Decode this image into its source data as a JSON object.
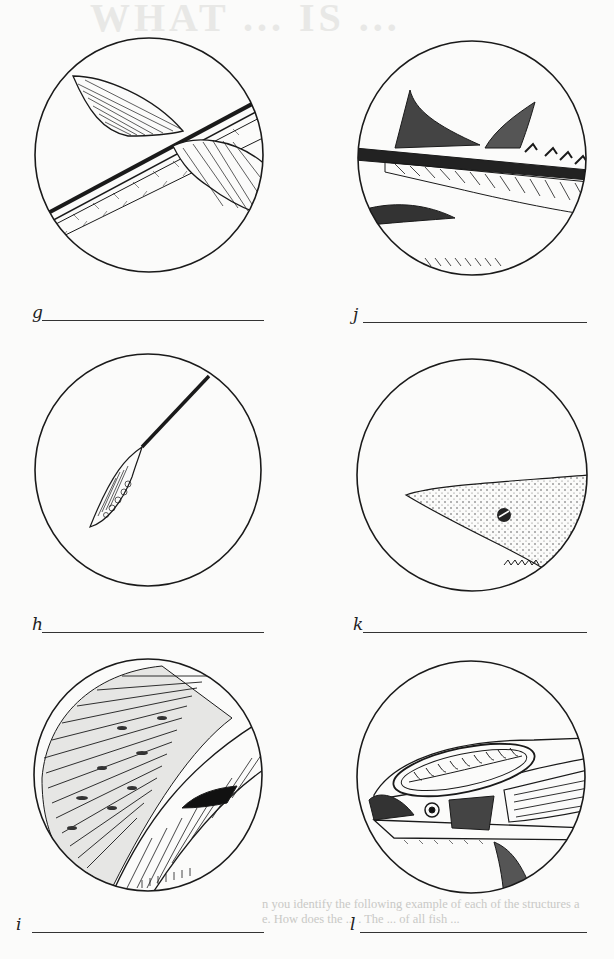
{
  "page": {
    "type": "worksheet",
    "background_color": "#fbfbfa",
    "ink_color": "#1a1a1a"
  },
  "bleed_through": {
    "top_heading": "WHAT ... IS ...",
    "bottom_line_1": "n you identify the following   example of each of the structures a",
    "bottom_line_2": "e. How does the ...              .  The ...  of all fish ..."
  },
  "figures": [
    {
      "id": "g",
      "label": "g",
      "subject": "pectoral fin crossing a long slender body (flying-fish wing)",
      "answer": ""
    },
    {
      "id": "j",
      "label": "j",
      "subject": "dorsal fins and finlets on back of a mackerel-like fish",
      "answer": ""
    },
    {
      "id": "h",
      "label": "h",
      "subject": "elongated whip-like tail filament ending in a lanceolate tip",
      "answer": ""
    },
    {
      "id": "k",
      "label": "k",
      "subject": "stippled shark head with eye and teeth",
      "answer": ""
    },
    {
      "id": "i",
      "label": "i",
      "subject": "large sail-like spiny dorsal fin (sailfish)",
      "answer": ""
    },
    {
      "id": "l",
      "label": "l",
      "subject": "head with suction disc on top (remora)",
      "answer": ""
    }
  ]
}
